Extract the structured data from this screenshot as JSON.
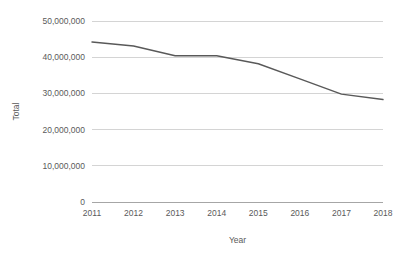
{
  "chart_data": {
    "type": "line",
    "title": "",
    "xlabel": "Year",
    "ylabel": "Total",
    "categories": [
      "2011",
      "2012",
      "2013",
      "2014",
      "2015",
      "2016",
      "2017",
      "2018"
    ],
    "values": [
      44200000,
      43100000,
      40400000,
      40400000,
      38200000,
      34000000,
      29800000,
      28300000
    ],
    "series": [
      {
        "name": "Total",
        "values": [
          44200000,
          43100000,
          40400000,
          40400000,
          38200000,
          34000000,
          29800000,
          28300000
        ]
      }
    ],
    "ylim": [
      0,
      50000000
    ],
    "ytick_values": [
      0,
      10000000,
      20000000,
      30000000,
      40000000,
      50000000
    ],
    "ytick_labels": [
      "0",
      "10,000,000",
      "20,000,000",
      "30,000,000",
      "40,000,000",
      "50,000,000"
    ],
    "xtick_labels": [
      "2011",
      "2012",
      "2013",
      "2014",
      "2015",
      "2016",
      "2017",
      "2018"
    ],
    "grid": "horizontal",
    "legend": "none",
    "line_color": "#595959",
    "grid_color": "#d4d4d4",
    "axis_color": "#a6a6a6",
    "text_color": "#5a5a5a",
    "background": "#ffffff"
  }
}
